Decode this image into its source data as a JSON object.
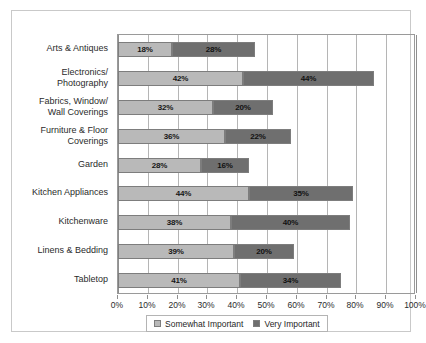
{
  "chart_data": {
    "type": "bar",
    "orientation": "horizontal",
    "stacked": true,
    "title": "",
    "subtitle": "",
    "xlabel": "",
    "ylabel": "",
    "xlim": [
      0,
      100
    ],
    "xtick_labels": [
      "0%",
      "10%",
      "20%",
      "30%",
      "40%",
      "50%",
      "60%",
      "70%",
      "80%",
      "90%",
      "100%"
    ],
    "xtick_values": [
      0,
      10,
      20,
      30,
      40,
      50,
      60,
      70,
      80,
      90,
      100
    ],
    "grid": true,
    "grid_axis": "x",
    "legend_position": "bottom",
    "categories": [
      "Arts & Antiques",
      "Electronics/\nPhotography",
      "Fabrics, Window/\nWall Coverings",
      "Furniture & Floor\nCoverings",
      "Garden",
      "Kitchen Appliances",
      "Kitchenware",
      "Linens & Bedding",
      "Tabletop"
    ],
    "series": [
      {
        "name": "Somewhat Important",
        "color": "#b9b9b9",
        "values": [
          18,
          42,
          32,
          36,
          28,
          44,
          38,
          39,
          41
        ],
        "labels": [
          "18%",
          "42%",
          "32%",
          "36%",
          "28%",
          "44%",
          "38%",
          "39%",
          "41%"
        ]
      },
      {
        "name": "Very Important",
        "color": "#6f6f6f",
        "values": [
          28,
          44,
          20,
          22,
          16,
          35,
          40,
          20,
          34
        ],
        "labels": [
          "28%",
          "44%",
          "20%",
          "22%",
          "16%",
          "35%",
          "40%",
          "20%",
          "34%"
        ]
      }
    ],
    "totals": [
      46,
      86,
      52,
      58,
      44,
      79,
      78,
      59,
      75
    ]
  },
  "legend": {
    "items": [
      {
        "label": "Somewhat Important",
        "color": "#b9b9b9"
      },
      {
        "label": "Very Important",
        "color": "#6f6f6f"
      }
    ]
  },
  "colors": {
    "somewhat_important": "#b9b9b9",
    "very_important": "#6f6f6f",
    "gridline": "#b5b5b5",
    "axis": "#8f8f8f",
    "frame": "#c9c9c9",
    "text": "#2b2b2b"
  }
}
